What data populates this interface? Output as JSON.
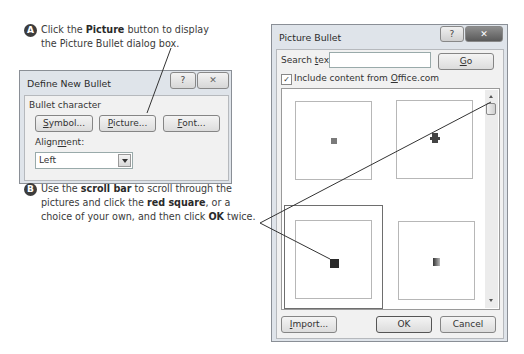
{
  "callouts": {
    "a": {
      "badge": "A",
      "line1_pre": "Click the ",
      "line1_bold": "Picture",
      "line1_post": " button to display",
      "line2": "the Picture Bullet dialog box."
    },
    "b": {
      "badge": "B",
      "line1_pre": "Use the ",
      "line1_bold": "scroll bar",
      "line1_post": " to scroll through the",
      "line2_pre": "pictures and click the ",
      "line2_bold": "red square",
      "line2_post": ", or a",
      "line3_pre": "choice of your own, and then click ",
      "line3_bold": "OK",
      "line3_post": " twice."
    }
  },
  "define_new_bullet": {
    "title": "Define New Bullet",
    "help_icon": "?",
    "close_icon": "✕",
    "group_label": "Bullet character",
    "buttons": {
      "symbol": {
        "u": "S",
        "rest": "ymbol..."
      },
      "picture": {
        "u": "P",
        "rest": "icture..."
      },
      "font": {
        "u": "F",
        "rest": "ont..."
      }
    },
    "alignment_label_pre": "Align",
    "alignment_label_u": "m",
    "alignment_label_post": "ent:",
    "alignment_value": "Left"
  },
  "picture_bullet": {
    "title": "Picture Bullet",
    "help_icon": "?",
    "close_icon": "✕",
    "search_label_pre": "Search ",
    "search_label_u": "t",
    "search_label_post": "ext:",
    "search_value": "",
    "go": {
      "u": "G",
      "rest": "o"
    },
    "include_checked": true,
    "include_pre": "Include content from ",
    "include_u": "O",
    "include_post": "ffice.com",
    "thumbnails": [
      {
        "name": "small-gray-square",
        "color": "#7a7a7a"
      },
      {
        "name": "dark-cross-bullet",
        "color": "#444444"
      },
      {
        "name": "red-square",
        "color": "#2a2a2a",
        "selected": true
      },
      {
        "name": "gradient-square",
        "color": "#555555"
      }
    ],
    "import": {
      "u": "I",
      "rest": "mport..."
    },
    "ok": "OK",
    "cancel": "Cancel"
  }
}
